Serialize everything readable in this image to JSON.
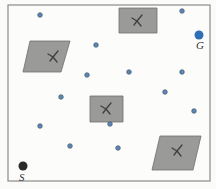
{
  "diagram": {
    "type": "motion-planning-workspace",
    "frame": {
      "x": 8,
      "y": 5,
      "width": 202,
      "height": 176,
      "stroke": "#8a8a8a"
    },
    "colors": {
      "obstacle_fill": "#9a9a98",
      "obstacle_stroke": "#6e6e6c",
      "sample_fill": "#5b86b8",
      "sample_stroke": "#4a5a6a",
      "goal_fill": "#2f6fb5",
      "start_fill": "#2a2a2a",
      "label": "#333333"
    },
    "start": {
      "label": "S",
      "x": 23,
      "y": 166,
      "r": 4.5,
      "label_x": 19,
      "label_y": 181
    },
    "goal": {
      "label": "G",
      "x": 199,
      "y": 35,
      "r": 4.5,
      "label_x": 196,
      "label_y": 49
    },
    "samples": [
      {
        "x": 40,
        "y": 15
      },
      {
        "x": 182,
        "y": 11
      },
      {
        "x": 96,
        "y": 45
      },
      {
        "x": 87,
        "y": 75
      },
      {
        "x": 129,
        "y": 72
      },
      {
        "x": 182,
        "y": 72
      },
      {
        "x": 165,
        "y": 92
      },
      {
        "x": 61,
        "y": 97
      },
      {
        "x": 40,
        "y": 126
      },
      {
        "x": 110,
        "y": 124
      },
      {
        "x": 194,
        "y": 111
      },
      {
        "x": 70,
        "y": 146
      },
      {
        "x": 118,
        "y": 148
      }
    ],
    "obstacles": [
      {
        "name": "obstacle-top-left",
        "points": "30,41 70,41 61,72 23,72",
        "mark_x": 53,
        "mark_y": 57
      },
      {
        "name": "obstacle-top",
        "points": "119,8 157,8 157,33 119,33",
        "mark_x": 137,
        "mark_y": 21
      },
      {
        "name": "obstacle-center",
        "points": "90,96 123,96 123,122 90,122",
        "mark_x": 106,
        "mark_y": 109
      },
      {
        "name": "obstacle-bottom-right",
        "points": "160,136 201,136 193,170 152,170",
        "mark_x": 177,
        "mark_y": 151
      }
    ]
  }
}
